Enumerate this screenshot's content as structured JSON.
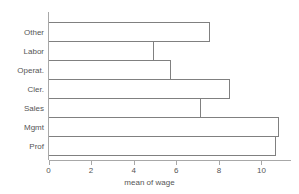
{
  "chart_data": {
    "type": "bar",
    "orientation": "horizontal",
    "title": "",
    "xlabel": "mean of wage",
    "ylabel": "",
    "categories": [
      "Other",
      "Labor",
      "Operat.",
      "Cler.",
      "Sales",
      "Mgmt",
      "Prof"
    ],
    "values": [
      7.56,
      4.93,
      5.73,
      8.5,
      7.14,
      10.8,
      10.66
    ],
    "xlim": [
      0,
      11.2
    ],
    "xticks": [
      0,
      2,
      4,
      6,
      8,
      10
    ],
    "xtick_labels": [
      "0",
      "2",
      "4",
      "6",
      "8",
      "10"
    ],
    "grid": false,
    "legend": null,
    "bar_fill": "none",
    "bar_stroke": "#808080",
    "axis_color": "#a8a8a8",
    "text_color": "#555555",
    "background": "#ffffff"
  }
}
